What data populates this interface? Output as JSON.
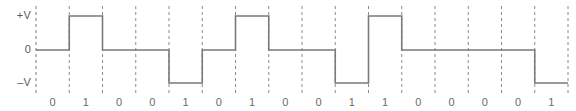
{
  "figure": {
    "line_color": "#7a7a7a",
    "grid_color": "#8a8a8a",
    "text_color": "#5a5a5a",
    "background": "#ffffff"
  },
  "axis": {
    "labels": [
      {
        "text": "+V",
        "level": "high"
      },
      {
        "text": "0",
        "level": "zero"
      },
      {
        "text": "–V",
        "level": "low"
      }
    ]
  },
  "chart_data": {
    "type": "line",
    "xlabel": "",
    "ylabel": "",
    "encoding": "bipolar-ami",
    "grid": true,
    "legend": false,
    "ylim": [
      -1,
      1
    ],
    "ytick_values": [
      1,
      0,
      -1
    ],
    "ytick_labels": [
      "+V",
      "0",
      "–V"
    ],
    "bit_count": 16,
    "categories": [
      "0",
      "1",
      "0",
      "0",
      "1",
      "0",
      "1",
      "0",
      "0",
      "1",
      "1",
      "0",
      "0",
      "0",
      "0",
      "1"
    ],
    "bits": [
      0,
      1,
      0,
      0,
      1,
      0,
      1,
      0,
      0,
      1,
      1,
      0,
      0,
      0,
      0,
      1
    ],
    "values": [
      0,
      1,
      0,
      0,
      -1,
      0,
      1,
      0,
      0,
      -1,
      1,
      0,
      0,
      0,
      0,
      -1
    ],
    "series": [
      {
        "name": "signal level",
        "values": [
          0,
          1,
          0,
          0,
          -1,
          0,
          1,
          0,
          0,
          -1,
          1,
          0,
          0,
          0,
          0,
          -1
        ]
      }
    ],
    "x": [
      0,
      1,
      2,
      3,
      4,
      5,
      6,
      7,
      8,
      9,
      10,
      11,
      12,
      13,
      14,
      15
    ]
  }
}
